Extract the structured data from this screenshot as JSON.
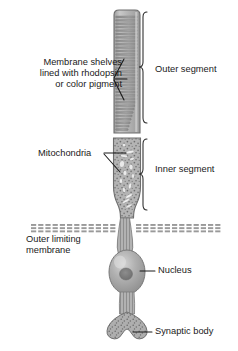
{
  "diagram": {
    "background_color": "#ffffff",
    "text_color": "#1a1a1a",
    "cell_fill": "#b0b0b0",
    "cell_outline": "#6e6e6e",
    "shelf_color": "#8d8d8d",
    "nucleus_fill": "#a8a8a8",
    "nucleolus_fill": "#7c7c7c",
    "membrane_color": "#9a9a9a"
  },
  "labels": {
    "membrane_shelves": {
      "line1": "Membrane shelves",
      "line2": "lined with rhodopsin",
      "line3": "or color pigment"
    },
    "mitochondria": "Mitochondria",
    "outer_limiting_membrane": {
      "line1": "Outer limiting",
      "line2": "membrane"
    },
    "outer_segment": "Outer segment",
    "inner_segment": "Inner segment",
    "nucleus": "Nucleus",
    "synaptic_body": "Synaptic body"
  },
  "structures": {
    "outer_segment": {
      "name": "outer-segment",
      "top": 10,
      "bottom": 133,
      "shelf_count": 34,
      "description": "stack of horizontal membrane discs"
    },
    "inner_segment": {
      "name": "inner-segment",
      "top": 138,
      "bottom": 218,
      "description": "stippled cytoplasm containing mitochondria"
    },
    "outer_limiting_membrane": {
      "name": "outer-limiting-membrane",
      "y": 228,
      "description": "horizontal dashed hatched band across the field"
    },
    "nucleus": {
      "name": "nucleus",
      "center_y": 272,
      "description": "oval nucleus with central nucleolus"
    },
    "synaptic_body": {
      "name": "synaptic-body",
      "center_y": 332,
      "description": "bilobed terminal foot"
    }
  },
  "brackets": [
    {
      "name": "outer-segment-bracket",
      "label": "Outer segment",
      "top": 10,
      "bottom": 133
    },
    {
      "name": "inner-segment-bracket",
      "label": "Inner segment",
      "top": 138,
      "bottom": 218
    }
  ]
}
